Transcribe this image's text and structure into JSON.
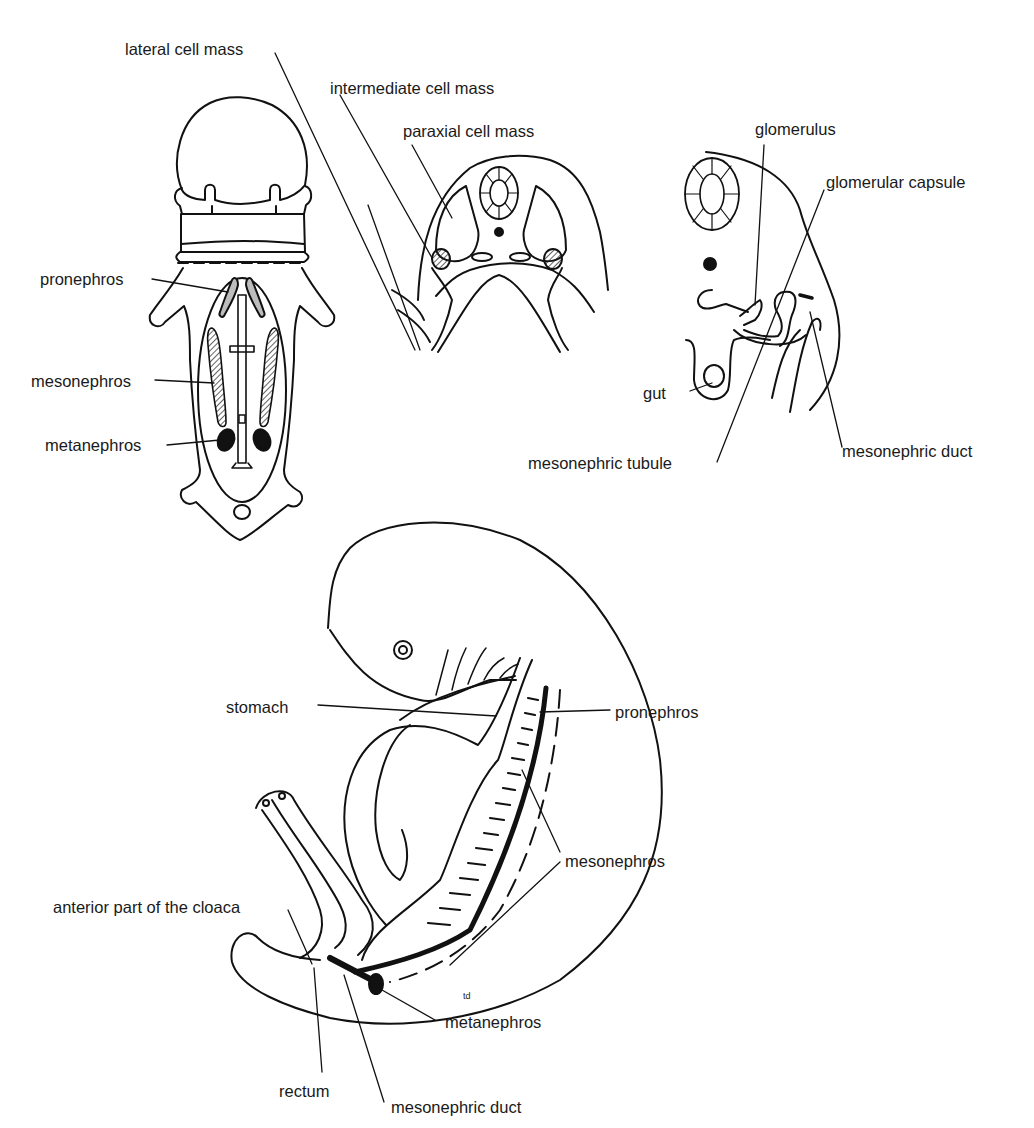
{
  "figure": {
    "panels": [
      {
        "id": "dorsal-view",
        "labels": {
          "pronephros": "pronephros",
          "mesonephros": "mesonephros",
          "metanephros": "metanephros"
        }
      },
      {
        "id": "cross-section-early",
        "labels": {
          "lateral_cell_mass": "lateral cell mass",
          "intermediate_cell_mass": "intermediate cell mass",
          "paraxial_cell_mass": "paraxial cell mass"
        }
      },
      {
        "id": "cross-section-late",
        "labels": {
          "glomerulus": "glomerulus",
          "glomerular_capsule": "glomerular capsule",
          "gut": "gut",
          "mesonephric_tubule": "mesonephric tubule",
          "mesonephric_duct": "mesonephric duct"
        }
      },
      {
        "id": "lateral-view",
        "labels": {
          "stomach": "stomach",
          "pronephros": "pronephros",
          "mesonephros": "mesonephros",
          "anterior_cloaca": "anterior part of the cloaca",
          "rectum": "rectum",
          "mesonephric_duct": "mesonephric duct",
          "metanephros": "metanephros",
          "initials": "td"
        }
      }
    ]
  }
}
